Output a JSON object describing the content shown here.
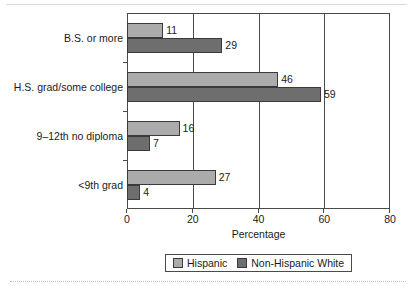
{
  "figure": {
    "top_crop_remnant": "",
    "background_color": "#ffffff"
  },
  "chart_data": {
    "type": "bar",
    "orientation": "horizontal",
    "title": "",
    "xlabel": "Percentage",
    "ylabel": "",
    "xlim": [
      0,
      80
    ],
    "xticks": [
      0,
      20,
      40,
      60,
      80
    ],
    "xtick_labels": [
      "0",
      "20",
      "40",
      "60",
      "80"
    ],
    "grid": true,
    "grid_axis": "x",
    "legend_position": "bottom",
    "categories": [
      "B.S. or more",
      "H.S. grad/some college",
      "9–12th no diploma",
      "<9th grad"
    ],
    "series": [
      {
        "name": "Hispanic",
        "color": "#ababab",
        "values": [
          11,
          46,
          16,
          27
        ],
        "value_labels": [
          "11",
          "46",
          "16",
          "27"
        ]
      },
      {
        "name": "Non-Hispanic White",
        "color": "#6e6e6e",
        "values": [
          29,
          59,
          7,
          4
        ],
        "value_labels": [
          "29",
          "59",
          "7",
          "4"
        ]
      }
    ]
  },
  "legend": {
    "items": [
      {
        "label": "Hispanic",
        "color": "#ababab"
      },
      {
        "label": "Non-Hispanic White",
        "color": "#6e6e6e"
      }
    ]
  },
  "colors": {
    "axis": "#4a4a4a",
    "bar_edge": "#3a3a3a",
    "text": "#1a1a1a",
    "series_light": "#ababab",
    "series_dark": "#6e6e6e"
  }
}
